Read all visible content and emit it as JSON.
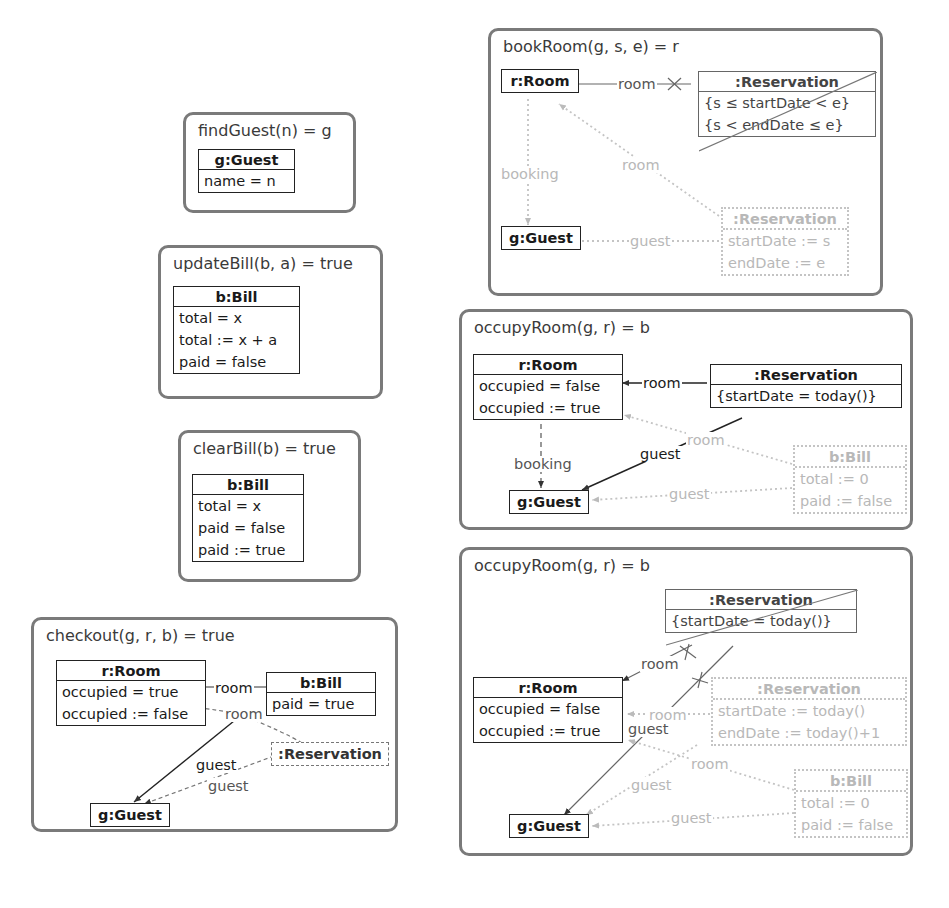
{
  "diagrams": {
    "findGuest": {
      "title": "findGuest(n) = g",
      "guest": {
        "header": "g:Guest",
        "rows": [
          "name = n"
        ]
      }
    },
    "updateBill": {
      "title": "updateBill(b, a) = true",
      "bill": {
        "header": "b:Bill",
        "rows": [
          "total = x",
          "total := x + a",
          "paid = false"
        ]
      }
    },
    "clearBill": {
      "title": "clearBill(b) = true",
      "bill": {
        "header": "b:Bill",
        "rows": [
          "total = x",
          "paid = false",
          "paid := true"
        ]
      }
    },
    "checkout": {
      "title": "checkout(g, r, b) = true",
      "room": {
        "header": "r:Room",
        "rows": [
          "occupied = true",
          "occupied := false"
        ]
      },
      "bill": {
        "header": "b:Bill",
        "rows": [
          "paid = true"
        ]
      },
      "reservation": {
        "header": ":Reservation"
      },
      "guest": {
        "header": "g:Guest"
      },
      "links": {
        "room1": "room",
        "room2": "room",
        "guest1": "guest",
        "guest2": "guest"
      }
    },
    "bookRoom": {
      "title": "bookRoom(g, s, e) = r",
      "room": {
        "header": "r:Room"
      },
      "guest": {
        "header": "g:Guest"
      },
      "neg_reservation": {
        "header": ":Reservation",
        "rows": [
          "{s ≤ startDate < e}",
          "{s < endDate ≤ e}"
        ]
      },
      "new_reservation": {
        "header": ":Reservation",
        "rows": [
          "startDate := s",
          "endDate := e"
        ]
      },
      "links": {
        "room_neg": "room",
        "booking": "booking",
        "room_new": "room",
        "guest_new": "guest"
      }
    },
    "occupyRoom1": {
      "title": "occupyRoom(g, r) = b",
      "room": {
        "header": "r:Room",
        "rows": [
          "occupied = false",
          "occupied := true"
        ]
      },
      "reservation": {
        "header": ":Reservation",
        "rows": [
          "{startDate = today()}"
        ]
      },
      "guest": {
        "header": "g:Guest"
      },
      "bill": {
        "header": "b:Bill",
        "rows": [
          "total := 0",
          "paid := false"
        ]
      },
      "links": {
        "room": "room",
        "booking": "booking",
        "guest": "guest",
        "room_bill": "room",
        "guest_bill": "guest"
      }
    },
    "occupyRoom2": {
      "title": "occupyRoom(g, r) = b",
      "neg_reservation": {
        "header": ":Reservation",
        "rows": [
          "{startDate = today()}"
        ]
      },
      "room": {
        "header": "r:Room",
        "rows": [
          "occupied = false",
          "occupied := true"
        ]
      },
      "new_reservation": {
        "header": ":Reservation",
        "rows": [
          "startDate := today()",
          "endDate := today()+1"
        ]
      },
      "guest": {
        "header": "g:Guest"
      },
      "bill": {
        "header": "b:Bill",
        "rows": [
          "total := 0",
          "paid := false"
        ]
      },
      "links": {
        "room_neg": "room",
        "guest_neg": "guest",
        "room_new": "room",
        "room_bill": "room",
        "guest_new": "guest",
        "guest_bill": "guest"
      }
    }
  },
  "colors": {
    "frame": "#7a7a7a",
    "created": "#c4c4c4",
    "text": "#1a1a1a"
  }
}
